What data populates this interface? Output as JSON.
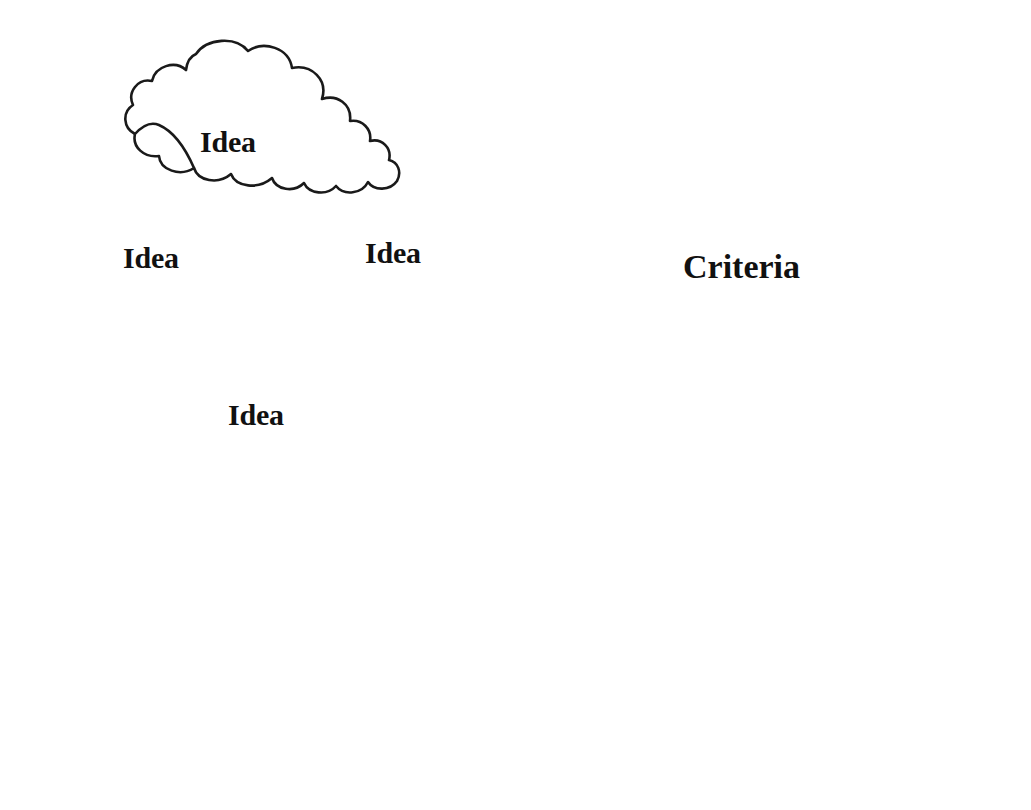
{
  "canvas": {
    "width": 1031,
    "height": 810,
    "background_color": "#ffffff",
    "ink_color": "#111111"
  },
  "clouds": [
    {
      "id": "cloud-top",
      "label": "Idea",
      "x": 130,
      "y": 38,
      "width": 215,
      "height": 152,
      "label_x": 200,
      "label_y": 125,
      "font_size": 30
    },
    {
      "id": "cloud-left",
      "label": "Idea",
      "x": 55,
      "y": 208,
      "width": 212,
      "height": 98,
      "label_x": 123,
      "label_y": 241,
      "font_size": 30
    },
    {
      "id": "cloud-middle-right",
      "label": "Idea",
      "x": 285,
      "y": 180,
      "width": 216,
      "height": 141,
      "label_x": 365,
      "label_y": 236,
      "font_size": 30
    },
    {
      "id": "cloud-bottom",
      "label": "Idea",
      "x": 165,
      "y": 355,
      "width": 211,
      "height": 116,
      "label_x": 228,
      "label_y": 398,
      "font_size": 30
    }
  ],
  "arrow": {
    "name": "flow-arrow",
    "tail_x": 383,
    "tail_y": 363,
    "head_x": 512,
    "head_y": 430,
    "head_style": "hollow-triangle",
    "tail_style": "feathered-split"
  },
  "criteria_sheet": {
    "title": "Criteria",
    "title_x": 683,
    "title_y": 252,
    "title_font_size": 34,
    "frame": {
      "x": 549,
      "y": 212,
      "width": 431,
      "height": 560
    },
    "rows": [
      {
        "index": 1,
        "checked": true,
        "checkbox_x": 598,
        "checkbox_y": 314,
        "checkbox_size": 46,
        "line_x1": 668,
        "line_x2": 947,
        "line_y": 366,
        "value": ""
      },
      {
        "index": 2,
        "checked": true,
        "checkbox_x": 598,
        "checkbox_y": 392,
        "checkbox_size": 46,
        "line_x1": 668,
        "line_x2": 947,
        "line_y": 444,
        "value": ""
      },
      {
        "index": 3,
        "checked": true,
        "checkbox_x": 598,
        "checkbox_y": 472,
        "checkbox_size": 46,
        "line_x1": 668,
        "line_x2": 947,
        "line_y": 524,
        "value": ""
      },
      {
        "index": 4,
        "checked": true,
        "checkbox_x": 598,
        "checkbox_y": 552,
        "checkbox_size": 46,
        "line_x1": 668,
        "line_x2": 947,
        "line_y": 604,
        "value": ""
      },
      {
        "index": 5,
        "checked": true,
        "checkbox_x": 598,
        "checkbox_y": 634,
        "checkbox_size": 46,
        "line_x1": 668,
        "line_x2": 947,
        "line_y": 687,
        "value": ""
      }
    ],
    "checked_glyph": "check-mark",
    "row_count": 5
  }
}
